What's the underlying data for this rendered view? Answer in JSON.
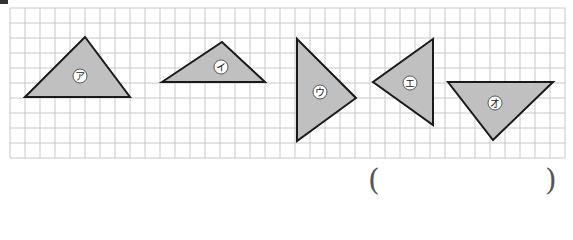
{
  "grid": {
    "x0": 10,
    "y0": 8,
    "cell": 15,
    "cols": 37,
    "rows": 10,
    "line_color": "#c8c8c8"
  },
  "fill_color": "#c0c0c0",
  "stroke_color": "#1a1a1a",
  "triangles": [
    {
      "label": "ア",
      "points": "25,97 85,37 130,97",
      "label_pos": [
        80,
        76
      ]
    },
    {
      "label": "イ",
      "points": "162,82 222,42 265,82",
      "label_pos": [
        221,
        67
      ]
    },
    {
      "label": "ウ",
      "points": "297,39 356,98 297,141",
      "label_pos": [
        320,
        92
      ]
    },
    {
      "label": "エ",
      "points": "433,39 373,82 433,125",
      "label_pos": [
        410,
        83
      ]
    },
    {
      "label": "オ",
      "points": "448,82 553,82 493,140",
      "label_pos": [
        495,
        103
      ]
    }
  ],
  "answer": {
    "open": "(",
    "close": ")",
    "value": ""
  }
}
